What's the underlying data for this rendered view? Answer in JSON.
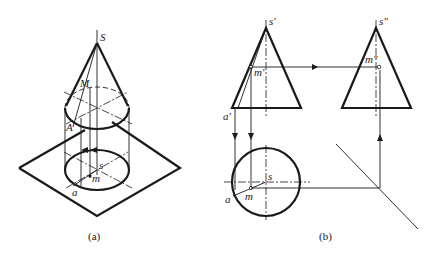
{
  "figure_a": {
    "caption": "(a)",
    "labels": {
      "apex": "S",
      "point_on_surface": "M",
      "generatrix_point": "A",
      "apex_projection": "s",
      "point_projection": "m",
      "base_point_projection": "a"
    }
  },
  "figure_b": {
    "caption": "(b)",
    "labels": {
      "front_apex": "s′",
      "front_point": "m′",
      "front_base_point": "a′",
      "side_apex": "s″",
      "side_point": "m″",
      "top_apex": "s",
      "top_point": "m",
      "top_base_point": "a"
    }
  },
  "colors": {
    "line": "#1a1a1a",
    "background": "#ffffff"
  }
}
